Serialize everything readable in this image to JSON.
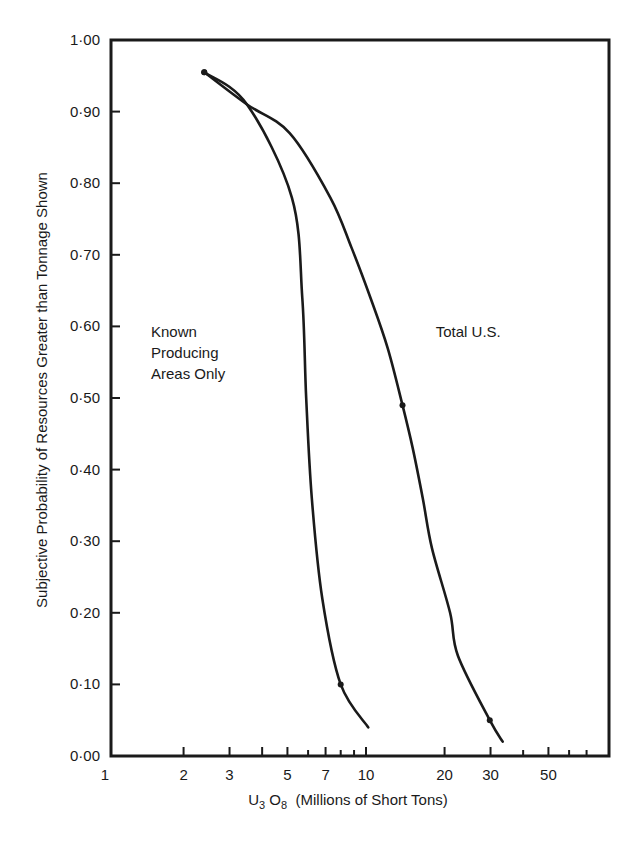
{
  "chart_data": {
    "type": "line",
    "title": "",
    "xlabel": "U3O8 (Millions of Short Tons)",
    "xlabel_parts": {
      "pre": "U",
      "sub1": "3",
      "mid": " O",
      "sub2": "8",
      "post": "  (Millions of Short Tons)"
    },
    "ylabel": "Subjective Probability of Resources Greater than Tonnage Shown",
    "xscale": "log",
    "xlim": [
      1,
      80
    ],
    "ylim": [
      0.0,
      1.0
    ],
    "grid": false,
    "x_tick_labels": [
      {
        "value": 1,
        "label": "1"
      },
      {
        "value": 2,
        "label": "2"
      },
      {
        "value": 3,
        "label": "3"
      },
      {
        "value": 5,
        "label": "5"
      },
      {
        "value": 7,
        "label": "7"
      },
      {
        "value": 10,
        "label": "10"
      },
      {
        "value": 20,
        "label": "20"
      },
      {
        "value": 30,
        "label": "30"
      },
      {
        "value": 50,
        "label": "50"
      }
    ],
    "x_minor_ticks": [
      2,
      3,
      4,
      5,
      6,
      7,
      8,
      9,
      10,
      20,
      30,
      40,
      50,
      60,
      70
    ],
    "y_tick_labels": [
      {
        "value": 1.0,
        "label": "1·00"
      },
      {
        "value": 0.9,
        "label": "0·90"
      },
      {
        "value": 0.8,
        "label": "0·80"
      },
      {
        "value": 0.7,
        "label": "0·70"
      },
      {
        "value": 0.6,
        "label": "0·60"
      },
      {
        "value": 0.5,
        "label": "0·50"
      },
      {
        "value": 0.4,
        "label": "0·40"
      },
      {
        "value": 0.3,
        "label": "0·30"
      },
      {
        "value": 0.2,
        "label": "0·20"
      },
      {
        "value": 0.1,
        "label": "0·10"
      },
      {
        "value": 0.0,
        "label": "0·00"
      }
    ],
    "series": [
      {
        "name": "Known Producing Areas Only",
        "label_lines": [
          "Known",
          "Producing",
          "Areas Only"
        ],
        "label_pos": {
          "x": 1.5,
          "y": 0.585
        },
        "x": [
          2.4,
          3.5,
          5.2,
          5.7,
          5.9,
          6.2,
          6.8,
          8.0,
          10.2
        ],
        "y": [
          0.955,
          0.91,
          0.78,
          0.64,
          0.5,
          0.36,
          0.22,
          0.1,
          0.04
        ],
        "markers": [
          {
            "x": 2.4,
            "y": 0.955
          },
          {
            "x": 8.0,
            "y": 0.1
          }
        ]
      },
      {
        "name": "Total U.S.",
        "label_lines": [
          "Total U.S."
        ],
        "label_pos": {
          "x": 18.5,
          "y": 0.585
        },
        "x": [
          2.4,
          3.5,
          5.1,
          7.3,
          8.8,
          10.4,
          12.1,
          13.8,
          15.1,
          16.5,
          17.9,
          21.0,
          22.5,
          29.8,
          33.4
        ],
        "y": [
          0.955,
          0.91,
          0.87,
          0.78,
          0.71,
          0.64,
          0.57,
          0.49,
          0.43,
          0.36,
          0.29,
          0.2,
          0.14,
          0.05,
          0.02
        ],
        "markers": [
          {
            "x": 2.4,
            "y": 0.955
          },
          {
            "x": 13.8,
            "y": 0.49
          },
          {
            "x": 29.8,
            "y": 0.05
          }
        ]
      }
    ]
  },
  "colors": {
    "ink": "#1a1a1a",
    "background": "#ffffff"
  }
}
